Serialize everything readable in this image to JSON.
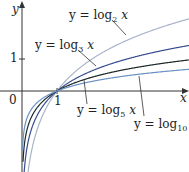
{
  "chart_data": {
    "type": "line",
    "title": "",
    "xlabel": "x",
    "ylabel": "y",
    "x_ticks": [
      "0",
      "1"
    ],
    "y_ticks": [
      "1"
    ],
    "xlim": [
      -0.6,
      4.8
    ],
    "ylim": [
      -2.5,
      2.8
    ],
    "series": [
      {
        "name": "y = log2 x",
        "base": 2,
        "color": "#a9b4c8"
      },
      {
        "name": "y = log3 x",
        "base": 3,
        "color": "#3a4f8f"
      },
      {
        "name": "y = log5 x",
        "base": 5,
        "color": "#1f2a2a"
      },
      {
        "name": "y = log10 x",
        "base": 10,
        "color": "#6c93c4"
      }
    ]
  },
  "labels": {
    "y_axis": "y",
    "x_axis": "x",
    "origin": "0",
    "x_tick_1": "1",
    "y_tick_1": "1",
    "log2_prefix": "y = log",
    "log2_base": "2",
    "log3_prefix": "y = log",
    "log3_base": "3",
    "log5_prefix": "y = log",
    "log5_base": "5",
    "log10_prefix": "y = log",
    "log10_base": "10",
    "var": "x"
  }
}
